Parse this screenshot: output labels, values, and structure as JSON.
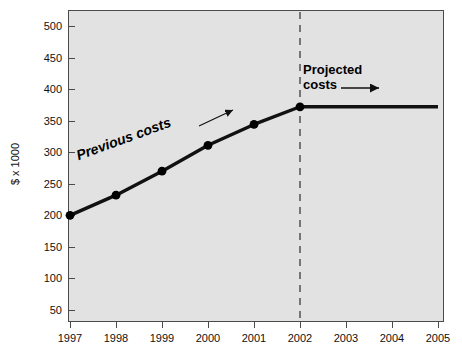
{
  "chart_data": {
    "type": "line",
    "title": "",
    "xlabel": "",
    "ylabel": "$ x 1000",
    "categories": [
      "1997",
      "1998",
      "1999",
      "2000",
      "2001",
      "2002",
      "2003",
      "2004",
      "2005"
    ],
    "x": [
      1997,
      1998,
      1999,
      2000,
      2001,
      2002,
      2003,
      2004,
      2005
    ],
    "xlim": [
      1997,
      2005
    ],
    "ylim": [
      0,
      525
    ],
    "ytick_labels": [
      "500",
      "450",
      "400",
      "350",
      "300",
      "250",
      "200",
      "150",
      "100",
      "50"
    ],
    "yticks": [
      500,
      450,
      400,
      350,
      300,
      250,
      200,
      150,
      100,
      50
    ],
    "grid": false,
    "legend": "none",
    "series": [
      {
        "name": "Previous costs",
        "x": [
          1997,
          1998,
          1999,
          2000,
          2001,
          2002
        ],
        "values": [
          200,
          232,
          270,
          311,
          344,
          372
        ],
        "markers": true,
        "style": "solid-thick"
      },
      {
        "name": "Projected costs",
        "x": [
          2002,
          2005
        ],
        "values": [
          372,
          372
        ],
        "markers": false,
        "style": "solid-thick"
      }
    ],
    "annotations": [
      {
        "name": "previous-costs",
        "text": "Previous costs",
        "rotated": true,
        "arrow": "diagonal-up-right"
      },
      {
        "name": "projected-costs",
        "text_line1": "Projected",
        "text_line2": "costs",
        "rotated": false,
        "arrow": "horizontal-right"
      },
      {
        "name": "projection-divider",
        "text": "",
        "style": "vertical-dashed",
        "at_x": 2002
      }
    ]
  },
  "colors": {
    "plot_background": "#e2e2e2",
    "page_background": "#ffffff",
    "axis": "#4a4a4a",
    "line": "#111111",
    "marker": "#000000",
    "divider": "#6a6a6a",
    "text": "#111111"
  },
  "axis": {
    "y_title": "$ x 1000",
    "y_ticks": [
      "500",
      "450",
      "400",
      "350",
      "300",
      "250",
      "200",
      "150",
      "100",
      "50"
    ],
    "x_ticks": [
      "1997",
      "1998",
      "1999",
      "2000",
      "2001",
      "2002",
      "2003",
      "2004",
      "2005"
    ]
  },
  "annotations": {
    "previous_costs": "Previous costs",
    "projected_costs_line1": "Projected",
    "projected_costs_line2": "costs"
  }
}
